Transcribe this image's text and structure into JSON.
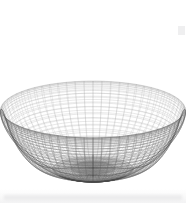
{
  "figure": {
    "title": "",
    "kind": "3d-wireframe-surface-plot",
    "width": 186,
    "height": 203,
    "background_color": "#ffffff",
    "line_color": "#6e6e6e",
    "line_color_light": "#9a9a9a",
    "line_color_dark": "#4a4a4a"
  },
  "chart_data": {
    "type": "line",
    "title": "",
    "xlabel": "",
    "ylabel": "",
    "subtitle": "",
    "legend": [],
    "annotations": [],
    "grid": false,
    "axes_visible": false,
    "tick_labels_x": [],
    "tick_labels_y": [],
    "surface": {
      "form": "spherical-harmonic-cusp",
      "u_samples": 64,
      "v_samples": 56,
      "u_range": [
        0,
        6.283185307179586
      ],
      "v_range": [
        0,
        3.141592653589793
      ],
      "radius_base": 1.0,
      "cusp_depth": 0.96,
      "cusp_sharpness": 3.2,
      "bottom_dimple": 0.14,
      "equator_bulge": 0.1
    },
    "view": {
      "azimuth_deg": 0,
      "elevation_deg": 18,
      "projection": "orthographic",
      "scale": 78,
      "center_x": 93,
      "center_y": 104,
      "y_squash": 0.52
    },
    "silhouette_bounds": {
      "left": 13,
      "right": 172,
      "top": 16,
      "bottom": 190
    },
    "features": [
      {
        "name": "cusp-tip",
        "x": 93,
        "y": 108
      },
      {
        "name": "left-lobe-crest",
        "x": 45,
        "y": 26
      },
      {
        "name": "right-lobe-crest",
        "x": 141,
        "y": 26
      },
      {
        "name": "bottom-dimple",
        "x": 93,
        "y": 185
      },
      {
        "name": "left-widest",
        "x": 13,
        "y": 116
      },
      {
        "name": "right-widest",
        "x": 172,
        "y": 116
      }
    ]
  }
}
